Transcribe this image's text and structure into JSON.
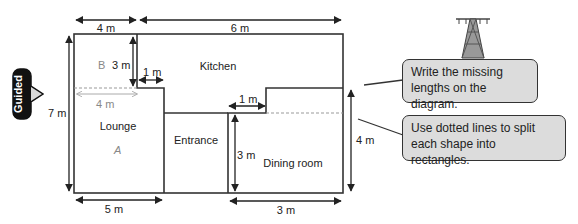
{
  "badge": {
    "label": "Guided"
  },
  "rooms": {
    "kitchen": "Kitchen",
    "lounge": "Lounge",
    "entrance": "Entrance",
    "dining": "Dining room"
  },
  "region_labels": {
    "a": "A",
    "b": "B"
  },
  "dimensions": {
    "top_left": "4 m",
    "top_right": "6 m",
    "left": "7 m",
    "kitchen_drop": "3 m",
    "kitchen_step": "1 m",
    "lounge_inner": "4 m",
    "dining_step": "1 m",
    "dining_height": "3 m",
    "right": "4 m",
    "bottom_left": "5 m",
    "bottom_right": "3 m"
  },
  "callouts": [
    {
      "text": "Write the missing lengths on the diagram."
    },
    {
      "text": "Use dotted lines to split each shape into rectangles."
    }
  ],
  "colors": {
    "line": "#222222",
    "callout_bg": "#dcdcdc",
    "dotted": "#999999"
  }
}
